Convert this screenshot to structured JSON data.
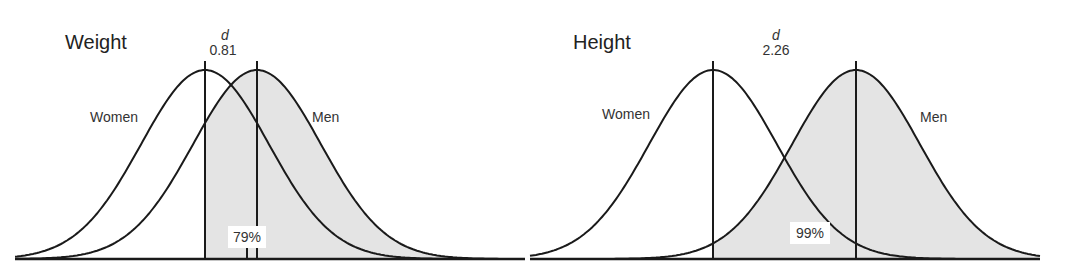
{
  "chart_data": [
    {
      "type": "area",
      "title": "Weight",
      "effect_size_symbol": "d",
      "effect_size": "0.81",
      "d_value": 0.81,
      "series": [
        {
          "name": "Women",
          "distribution": "normal",
          "mean": 0,
          "sd": 1
        },
        {
          "name": "Men",
          "distribution": "normal",
          "mean": 0.81,
          "sd": 1
        }
      ],
      "shaded_region": "Men distribution above Women mean",
      "annotation": "79%",
      "percent_men_above_women_mean": 79,
      "xlabel": "",
      "ylabel": "",
      "grid": false,
      "legend": "inline labels"
    },
    {
      "type": "area",
      "title": "Height",
      "effect_size_symbol": "d",
      "effect_size": "2.26",
      "d_value": 2.26,
      "series": [
        {
          "name": "Women",
          "distribution": "normal",
          "mean": 0,
          "sd": 1
        },
        {
          "name": "Men",
          "distribution": "normal",
          "mean": 2.26,
          "sd": 1
        }
      ],
      "shaded_region": "Men distribution above Women mean",
      "annotation": "99%",
      "percent_men_above_women_mean": 99,
      "xlabel": "",
      "ylabel": "",
      "grid": false,
      "legend": "inline labels"
    }
  ],
  "left": {
    "title": "Weight",
    "d_symbol": "d",
    "d_value": "0.81",
    "women": "Women",
    "men": "Men",
    "pct": "79%"
  },
  "right": {
    "title": "Height",
    "d_symbol": "d",
    "d_value": "2.26",
    "women": "Women",
    "men": "Men",
    "pct": "99%"
  },
  "colors": {
    "line": "#1a1a1a",
    "shade": "#e4e4e4",
    "text": "#333333"
  }
}
